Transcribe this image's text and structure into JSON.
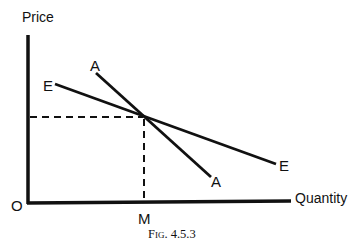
{
  "diagram": {
    "axes": {
      "y_label": "Price",
      "x_label": "Quantity",
      "origin_label": "O"
    },
    "curves": [
      {
        "name": "E",
        "label_start": "E",
        "label_end": "E",
        "description": "flatter (more elastic) demand curve"
      },
      {
        "name": "A",
        "label_start": "A",
        "label_end": "A",
        "description": "steeper (less elastic) demand curve"
      }
    ],
    "intersection": {
      "quantity_label": "M",
      "guides": "dashed lines to both axes"
    },
    "caption": "Fig. 4.5.3",
    "colors": {
      "ink": "#111111",
      "background": "#ffffff"
    }
  }
}
